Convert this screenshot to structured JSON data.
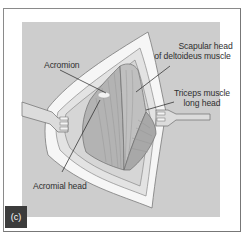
{
  "figure": {
    "panel_label": "(c)",
    "labels": {
      "acromion": "Acromion",
      "scapular_head_line1": "Scapular head",
      "scapular_head_line2": "of deltoideus muscle",
      "triceps_line1": "Triceps muscle",
      "triceps_line2": "long head",
      "acromial_head": "Acromial head"
    },
    "colors": {
      "background_panel": "#cdcdcd",
      "skin_edge": "#f4f4f4",
      "muscle_light": "#bdbdbd",
      "muscle_dark": "#9a9a9a",
      "outline": "#6d6d6d",
      "badge": "#3c3c3c"
    }
  }
}
